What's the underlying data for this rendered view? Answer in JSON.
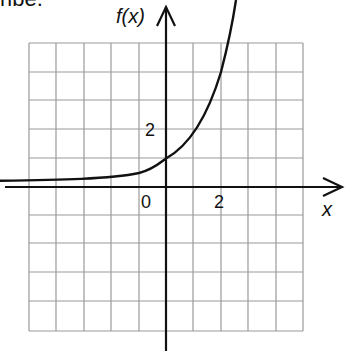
{
  "header": {
    "cut_text": "ribe."
  },
  "graph": {
    "y_label": "f(x)",
    "x_label": "x",
    "origin_label": "0",
    "x_tick_label": "2",
    "y_tick_label": "2",
    "function": "f(x) = 2^x",
    "grid": {
      "columns": 10,
      "rows": 10,
      "x_range": [
        -6,
        5
      ],
      "y_range": [
        -6,
        5
      ]
    },
    "colors": {
      "grid": "#9a9a9a",
      "axis": "#111111",
      "curve": "#111111"
    }
  }
}
